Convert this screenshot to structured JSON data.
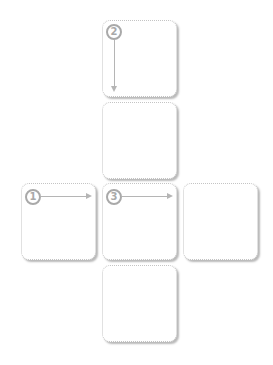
{
  "diagram": {
    "type": "cube-net",
    "boxes": [
      {
        "id": "top",
        "label": ""
      },
      {
        "id": "upper-middle",
        "label": ""
      },
      {
        "id": "left",
        "label": ""
      },
      {
        "id": "center",
        "label": ""
      },
      {
        "id": "right",
        "label": ""
      },
      {
        "id": "bottom",
        "label": ""
      }
    ],
    "steps": [
      {
        "number": "1",
        "direction": "right",
        "box": "left"
      },
      {
        "number": "2",
        "direction": "down",
        "box": "top"
      },
      {
        "number": "3",
        "direction": "right",
        "box": "center"
      }
    ],
    "colors": {
      "border": "#c4c4c4",
      "marker": "#a9a9a9",
      "arrow": "#b5b5b5"
    }
  }
}
